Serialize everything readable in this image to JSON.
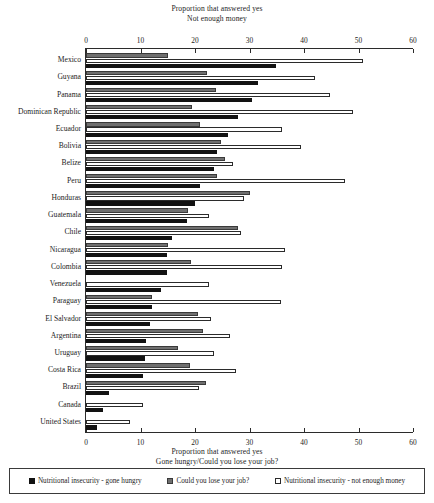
{
  "titles": {
    "top_line1": "Proportion that answered yes",
    "top_line2": "Not enough money",
    "bottom_line1": "Proportion that answered yes",
    "bottom_line2": "Gone hungry/Could you lose your job?"
  },
  "legend": {
    "items": [
      {
        "key": "hungry",
        "label": "Nutritional insecurity - gone hungry",
        "color": "#121212",
        "swatch": "filled-black-square-icon"
      },
      {
        "key": "job",
        "label": "Could you lose your job?",
        "color": "#6f6f6f",
        "swatch": "filled-gray-square-icon"
      },
      {
        "key": "money",
        "label": "Nutritional insecurity - not enough money",
        "color": "#ffffff",
        "swatch": "outlined-white-square-icon"
      }
    ]
  },
  "chart_data": {
    "type": "bar",
    "orientation": "horizontal",
    "title": "Proportion that answered yes",
    "subtitle_top": "Not enough money",
    "subtitle_bottom": "Gone hungry/Could you lose your job?",
    "xlabel": "Proportion that answered yes",
    "ylabel": "",
    "xlim": [
      0,
      60
    ],
    "xticks": [
      0,
      10,
      20,
      30,
      40,
      50,
      60
    ],
    "xtick_labels": [
      "0",
      "10",
      "20",
      "30",
      "40",
      "50",
      "60"
    ],
    "grid": false,
    "legend_position": "bottom",
    "dual_axis": true,
    "categories": [
      "Mexico",
      "Guyana",
      "Panama",
      "Dominican Republic",
      "Ecuador",
      "Bolivia",
      "Belize",
      "Peru",
      "Honduras",
      "Guatemala",
      "Chile",
      "Nicaragua",
      "Colombia",
      "Venezuela",
      "Paraguay",
      "El Salvador",
      "Argentina",
      "Uruguay",
      "Costa Rica",
      "Brazil",
      "Canada",
      "United States"
    ],
    "series": [
      {
        "name": "Could you lose your job?",
        "key": "job",
        "color": "#6f6f6f",
        "values": [
          15.0,
          22.2,
          23.8,
          19.4,
          21.0,
          24.8,
          25.5,
          24.0,
          30.0,
          18.8,
          27.8,
          15.0,
          19.2,
          0.0,
          12.2,
          20.5,
          21.5,
          16.8,
          19.0,
          22.0,
          0.0,
          0.0
        ]
      },
      {
        "name": "Nutritional insecurity - not enough money",
        "key": "money",
        "color": "#ffffff",
        "values": [
          50.8,
          42.0,
          44.8,
          49.0,
          36.0,
          39.5,
          27.0,
          47.5,
          29.0,
          22.5,
          28.5,
          36.5,
          36.0,
          22.5,
          35.8,
          23.0,
          26.5,
          23.5,
          27.5,
          20.8,
          10.5,
          8.0
        ]
      },
      {
        "name": "Nutritional insecurity - gone hungry",
        "key": "hungry",
        "color": "#121212",
        "values": [
          34.8,
          31.5,
          30.5,
          27.8,
          26.0,
          24.0,
          23.5,
          21.0,
          20.0,
          18.5,
          15.8,
          14.8,
          14.8,
          13.8,
          12.2,
          11.8,
          11.0,
          10.8,
          10.5,
          4.2,
          3.2,
          2.0
        ]
      }
    ]
  }
}
